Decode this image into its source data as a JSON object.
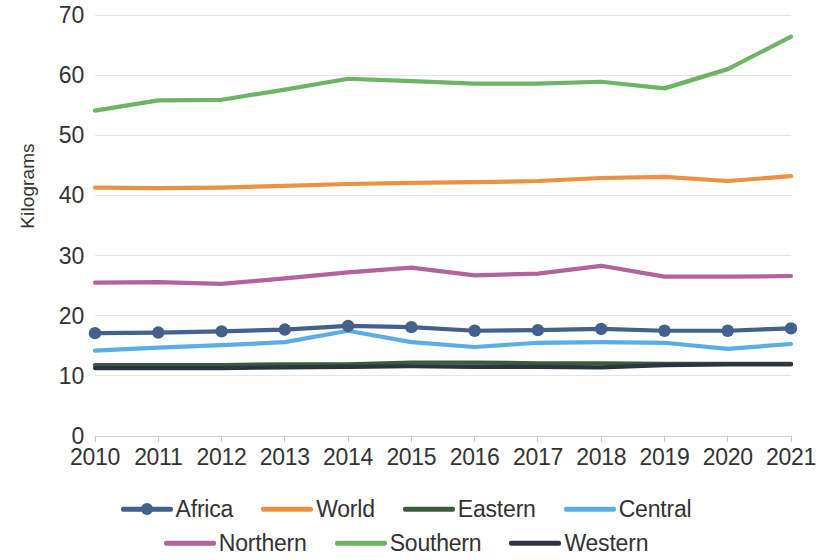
{
  "chart_data": {
    "type": "line",
    "title": "",
    "subtitle": "",
    "xlabel": "",
    "ylabel": "Kilograms",
    "ylim": [
      0,
      70
    ],
    "y_ticks": [
      0,
      10,
      20,
      30,
      40,
      50,
      60,
      70
    ],
    "grid": true,
    "legend_position": "bottom",
    "categories": [
      "2010",
      "2011",
      "2012",
      "2013",
      "2014",
      "2015",
      "2016",
      "2017",
      "2018",
      "2019",
      "2020",
      "2021"
    ],
    "x": [
      2010,
      2011,
      2012,
      2013,
      2014,
      2015,
      2016,
      2017,
      2018,
      2019,
      2020,
      2021
    ],
    "series": [
      {
        "name": "Africa",
        "color": "#44618E",
        "marker": "circle",
        "values": [
          17.1,
          17.2,
          17.4,
          17.7,
          18.3,
          18.1,
          17.5,
          17.6,
          17.8,
          17.5,
          17.5,
          17.9
        ]
      },
      {
        "name": "World",
        "color": "#ED9040",
        "marker": "none",
        "values": [
          41.3,
          41.2,
          41.3,
          41.6,
          41.9,
          42.1,
          42.2,
          42.4,
          42.9,
          43.1,
          42.4,
          43.2
        ]
      },
      {
        "name": "Eastern",
        "color": "#3D5A3A",
        "marker": "none",
        "values": [
          11.8,
          11.8,
          11.8,
          11.9,
          11.9,
          12.2,
          12.2,
          12.1,
          12.1,
          12.0,
          12.0,
          12.0
        ]
      },
      {
        "name": "Central",
        "color": "#5BADE5",
        "marker": "none",
        "values": [
          14.2,
          14.7,
          15.1,
          15.6,
          17.5,
          15.6,
          14.8,
          15.5,
          15.6,
          15.5,
          14.5,
          15.3
        ]
      },
      {
        "name": "Northern",
        "color": "#B2639B",
        "marker": "none",
        "values": [
          25.5,
          25.6,
          25.3,
          26.2,
          27.2,
          28.0,
          26.7,
          27.0,
          28.3,
          26.5,
          26.5,
          26.6
        ]
      },
      {
        "name": "Southern",
        "color": "#6CB563",
        "marker": "none",
        "values": [
          54.1,
          55.8,
          55.9,
          57.6,
          59.4,
          59.0,
          58.6,
          58.6,
          58.9,
          57.8,
          61.0,
          66.4
        ]
      },
      {
        "name": "Western",
        "color": "#2B3440",
        "marker": "none",
        "values": [
          11.3,
          11.3,
          11.3,
          11.4,
          11.5,
          11.6,
          11.5,
          11.5,
          11.4,
          11.8,
          11.9,
          11.9
        ]
      }
    ]
  }
}
